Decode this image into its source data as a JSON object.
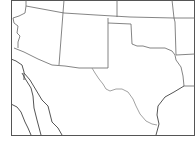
{
  "map": {
    "title": "Southwestern United States outline map",
    "region": "Southwest US",
    "style": "blank outline, state boundaries",
    "colors": {
      "background": "#ffffff",
      "frame": "#555555",
      "borders": "#666666",
      "river": "#8a8a8a"
    },
    "states_depicted": [
      "Arizona",
      "New Mexico",
      "Texas",
      "Oklahoma",
      "Colorado",
      "Utah",
      "Kansas",
      "Arkansas",
      "Louisiana",
      "California",
      "Nevada"
    ],
    "labels": []
  }
}
